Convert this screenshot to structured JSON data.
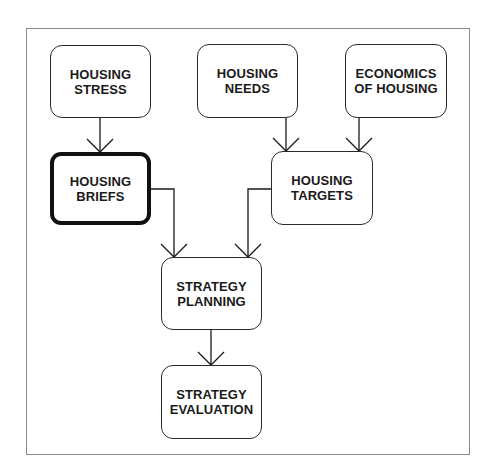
{
  "diagram": {
    "type": "flowchart",
    "nodes": [
      {
        "id": "housing_stress",
        "label": "HOUSING\nSTRESS",
        "emphasized": false
      },
      {
        "id": "housing_needs",
        "label": "HOUSING\nNEEDS",
        "emphasized": false
      },
      {
        "id": "economics_of_housing",
        "label": "ECONOMICS\nOF HOUSING",
        "emphasized": false
      },
      {
        "id": "housing_briefs",
        "label": "HOUSING\nBRIEFS",
        "emphasized": true
      },
      {
        "id": "housing_targets",
        "label": "HOUSING\nTARGETS",
        "emphasized": false
      },
      {
        "id": "strategy_planning",
        "label": "STRATEGY\nPLANNING",
        "emphasized": false
      },
      {
        "id": "strategy_evaluation",
        "label": "STRATEGY\nEVALUATION",
        "emphasized": false
      }
    ],
    "edges": [
      {
        "from": "housing_stress",
        "to": "housing_briefs"
      },
      {
        "from": "housing_needs",
        "to": "housing_targets"
      },
      {
        "from": "economics_of_housing",
        "to": "housing_targets"
      },
      {
        "from": "housing_briefs",
        "to": "strategy_planning"
      },
      {
        "from": "housing_targets",
        "to": "strategy_planning"
      },
      {
        "from": "strategy_planning",
        "to": "strategy_evaluation"
      }
    ],
    "colors": {
      "line": "#1a1a1a",
      "frame": "#8a8a8a",
      "background": "#ffffff"
    }
  }
}
